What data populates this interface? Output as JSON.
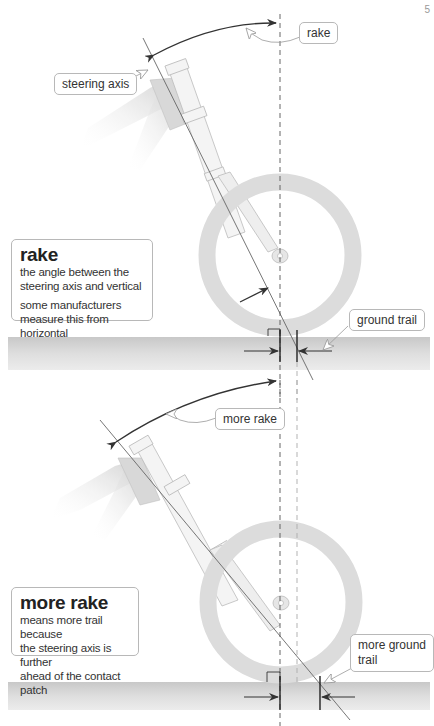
{
  "page": {
    "number_fragment": "5"
  },
  "panel_top": {
    "labels": {
      "rake": "rake",
      "steering_axis": "steering axis",
      "ground_trail": "ground trail"
    },
    "info_box": {
      "title": "rake",
      "lines": [
        "the angle between the",
        "steering axis and vertical"
      ],
      "note_lines": [
        "some manufacturers",
        "measure this from horizontal"
      ]
    }
  },
  "panel_bottom": {
    "labels": {
      "more_rake": "more rake",
      "more_ground_trail_1": "more ground",
      "more_ground_trail_2": "trail"
    },
    "info_box": {
      "title": "more rake",
      "lines": [
        "means more trail because",
        "the steering axis is further",
        "ahead of the contact patch"
      ]
    }
  },
  "colors": {
    "ground": "#d9d9d9",
    "wheel": "#dcdcdc",
    "frame": "#d0d0d0",
    "line": "#555555",
    "arrow": "#333333",
    "dashed": "#555555",
    "dashed_light": "#aaaaaa"
  }
}
